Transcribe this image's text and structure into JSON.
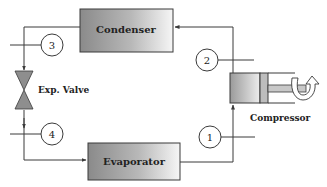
{
  "diagram": {
    "components": {
      "condenser": {
        "label": "Condenser"
      },
      "evaporator": {
        "label": "Evaporator"
      },
      "expansion_valve": {
        "label": "Exp. Valve"
      },
      "compressor": {
        "label": "Compressor"
      }
    },
    "states": [
      {
        "id": "1",
        "label": "1"
      },
      {
        "id": "2",
        "label": "2"
      },
      {
        "id": "3",
        "label": "3"
      },
      {
        "id": "4",
        "label": "4"
      }
    ],
    "colors": {
      "line": "#3a3a3a",
      "box_dark": "#8c8c8c",
      "box_light": "#f4f4f4",
      "valve": "#8e8e8e"
    }
  }
}
